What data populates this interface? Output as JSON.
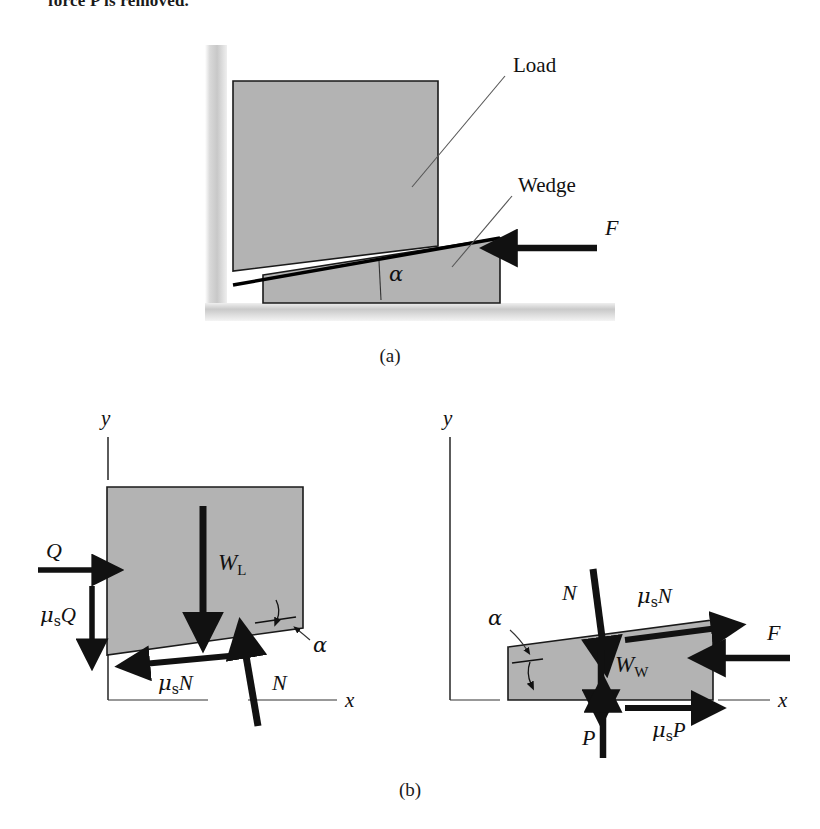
{
  "page": {
    "cut_off_text": "force P is removed.",
    "caption_a": "(a)",
    "caption_b": "(b)",
    "colors": {
      "body_fill": "#b3b3b3",
      "outline": "#000000",
      "leader_line": "#555555",
      "axis": "#333333",
      "arrow": "#111111",
      "wall_shade": "#cfcfcf",
      "ground_shade": "#d0d0d0",
      "background": "#ffffff"
    }
  },
  "figure_a": {
    "name": "wedge-and-load-assembly",
    "labels": {
      "load": "Load",
      "wedge": "Wedge",
      "alpha": "α",
      "force_f": "F"
    },
    "geometry": {
      "wall_x": 212,
      "wall_top": 45,
      "wall_bottom": 310,
      "ground_y": 303,
      "ground_left": 205,
      "ground_right": 615,
      "load_left": 233,
      "load_right": 438,
      "load_top": 81,
      "load_bottom_left": 271,
      "load_bottom_right": 246,
      "wedge_left": 263,
      "wedge_right": 500,
      "wedge_base_y": 303,
      "wedge_apex_y": 238,
      "alpha_deg": 8
    },
    "force_f": {
      "direction": "left",
      "x_tail": 597,
      "x_head": 500,
      "y": 248
    }
  },
  "figure_b": {
    "name": "free-body-diagrams",
    "left": {
      "name": "load-free-body-diagram",
      "axis_labels": {
        "y": "y",
        "x": "x"
      },
      "forces": [
        {
          "name": "Q",
          "label": "Q",
          "direction": "right"
        },
        {
          "name": "mu-s-Q",
          "label": "μsQ",
          "mu": "μ",
          "subscript": "s",
          "base": "Q",
          "direction": "down"
        },
        {
          "name": "W-L",
          "label": "WL",
          "base": "W",
          "subscript": "L",
          "direction": "down"
        },
        {
          "name": "mu-s-N",
          "label": "μsN",
          "mu": "μ",
          "subscript": "s",
          "base": "N",
          "direction": "left-along-incline"
        },
        {
          "name": "N",
          "label": "N",
          "direction": "up-normal-to-incline"
        }
      ],
      "alpha": "α"
    },
    "right": {
      "name": "wedge-free-body-diagram",
      "axis_labels": {
        "y": "y",
        "x": "x"
      },
      "forces": [
        {
          "name": "N",
          "label": "N",
          "direction": "down-normal-to-incline"
        },
        {
          "name": "mu-s-N",
          "label": "μsN",
          "mu": "μ",
          "subscript": "s",
          "base": "N",
          "direction": "right-along-incline"
        },
        {
          "name": "W-W",
          "label": "WW",
          "base": "W",
          "subscript": "W",
          "direction": "down"
        },
        {
          "name": "F",
          "label": "F",
          "direction": "left"
        },
        {
          "name": "P",
          "label": "P",
          "direction": "up"
        },
        {
          "name": "mu-s-P",
          "label": "μsP",
          "mu": "μ",
          "subscript": "s",
          "base": "P",
          "direction": "right"
        }
      ],
      "alpha": "α"
    }
  }
}
